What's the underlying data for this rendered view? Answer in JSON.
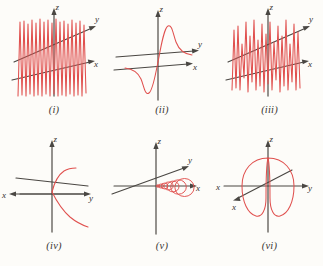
{
  "figure": {
    "background_color": "#fdfcf9",
    "curve_color": "#e0504e",
    "axis_color": "#4a4743",
    "layout": "2 rows x 3 columns",
    "panels": [
      {
        "id": "i",
        "caption": "(i)",
        "axis_labels": {
          "x": "x",
          "y": "y",
          "z": "z"
        },
        "axis_orientation": "z up, y upper-right diagonal, x lower-right diagonal",
        "curve_description": "dense vertical oscillation with constant tall amplitude, many cycles spanning left to right"
      },
      {
        "id": "ii",
        "caption": "(ii)",
        "axis_labels": {
          "x": "x",
          "y": "y",
          "z": "z"
        },
        "axis_orientation": "z up, y right, x lower-right diagonal",
        "curve_description": "odd-symmetric curve with sharp peak above origin decaying to the right and mirrored trough below decaying to the left"
      },
      {
        "id": "iii",
        "caption": "(iii)",
        "axis_labels": {
          "x": "x",
          "y": "y",
          "z": "z"
        },
        "axis_orientation": "z up, y upper-right diagonal, x lower-right diagonal",
        "curve_description": "oscillation with varying beat envelope, amplitude waxing and waning across the span"
      },
      {
        "id": "iv",
        "caption": "(iv)",
        "axis_labels": {
          "x": "x",
          "y": "y",
          "z": "z"
        },
        "axis_orientation": "z up, x to the left, y to the right, extra diagonal axis",
        "curve_description": "two short smooth arcs meeting near origin, one rising to upper right and one falling to lower right"
      },
      {
        "id": "v",
        "caption": "(v)",
        "axis_labels": {
          "x": "x",
          "y": "y",
          "z": "z"
        },
        "axis_orientation": "z up, y upper-right diagonal, x right",
        "curve_description": "spiral of growing radius winding along the positive x-axis away from the origin"
      },
      {
        "id": "vi",
        "caption": "(vi)",
        "axis_labels": {
          "x": "x",
          "x2": "x",
          "y": "y",
          "z": "z"
        },
        "axis_orientation": "z up, y right, x left, second x axis on lower-left diagonal",
        "curve_description": "large closed loop resembling two overlapping vertical rings around the z-axis"
      }
    ]
  }
}
